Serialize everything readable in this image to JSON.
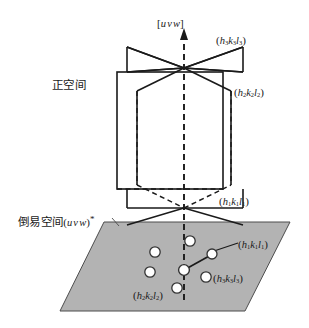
{
  "figure": {
    "width": 309,
    "height": 328,
    "background": "#ffffff"
  },
  "colors": {
    "line": "#1a1a1a",
    "plane_fill": "#b3b3b3",
    "plane_stroke": "#4d4d4d",
    "point_fill": "#ffffff",
    "point_stroke": "#333333",
    "text": "#1a1a1a"
  },
  "axis": {
    "label_open": "[",
    "label_u": "u",
    "label_v": "v",
    "label_w": "w",
    "label_close": "]",
    "name": "zone-axis-uvw",
    "style": "dashed-with-arrow",
    "direction": "vertical-up"
  },
  "regions": {
    "real_space_label": "正空间",
    "reciprocal_space_label": "倒易空间",
    "reciprocal_space_paren_open": "(",
    "reciprocal_space_u": "u",
    "reciprocal_space_v": "v",
    "reciprocal_space_w": "w",
    "reciprocal_space_paren_close": ")",
    "reciprocal_space_star": "*"
  },
  "real_space_planes": [
    {
      "id": "plane-h3k3l3",
      "paren_open": "(",
      "h": "h",
      "h_sub": "3",
      "k": "k",
      "k_sub": "3",
      "l": "l",
      "l_sub": "3",
      "paren_close": ")",
      "description": "inclined bowtie plane, label upper right"
    },
    {
      "id": "plane-h2k2l2",
      "paren_open": "(",
      "h": "h",
      "h_sub": "2",
      "k": "k",
      "k_sub": "2",
      "l": "l",
      "l_sub": "2",
      "paren_close": ")",
      "description": "outer flat rectangular plane, label right middle"
    },
    {
      "id": "plane-h1k1l1",
      "paren_open": "(",
      "h": "h",
      "h_sub": "1",
      "k": "k",
      "k_sub": "1",
      "l": "l",
      "l_sub": "1",
      "paren_close": ")",
      "description": "lower bowtie plane, label lower right"
    }
  ],
  "reciprocal_points": [
    {
      "id": "rp-origin",
      "cx": 184,
      "cy": 270,
      "r": 5.2,
      "label": null
    },
    {
      "id": "rp-h1k1l1",
      "cx": 212,
      "cy": 254,
      "r": 5.0,
      "paren_open": "(",
      "h": "h",
      "h_sub": "1",
      "k": "k",
      "k_sub": "1",
      "l": "l",
      "l_sub": "1",
      "paren_close": ")"
    },
    {
      "id": "rp-upper",
      "cx": 190,
      "cy": 241,
      "r": 5.2,
      "label": null
    },
    {
      "id": "rp-left-upper",
      "cx": 155,
      "cy": 252,
      "r": 5.2,
      "label": null
    },
    {
      "id": "rp-left-lower",
      "cx": 150,
      "cy": 272,
      "r": 5.2,
      "label": null
    },
    {
      "id": "rp-h2k2l2",
      "cx": 177,
      "cy": 288,
      "r": 5.2,
      "paren_open": "(",
      "h": "h",
      "h_sub": "2",
      "k": "k",
      "k_sub": "2",
      "l": "l",
      "l_sub": "2",
      "paren_close": ")"
    },
    {
      "id": "rp-h3k3l3",
      "cx": 206,
      "cy": 277,
      "r": 5.2,
      "paren_open": "(",
      "h": "h",
      "h_sub": "3",
      "k": "k",
      "k_sub": "3",
      "l": "l",
      "l_sub": "3",
      "paren_close": ")"
    }
  ],
  "vector": {
    "name": "reciprocal-lattice-vector",
    "from_x": 184,
    "from_y": 270,
    "to_x": 210,
    "to_y": 255
  }
}
